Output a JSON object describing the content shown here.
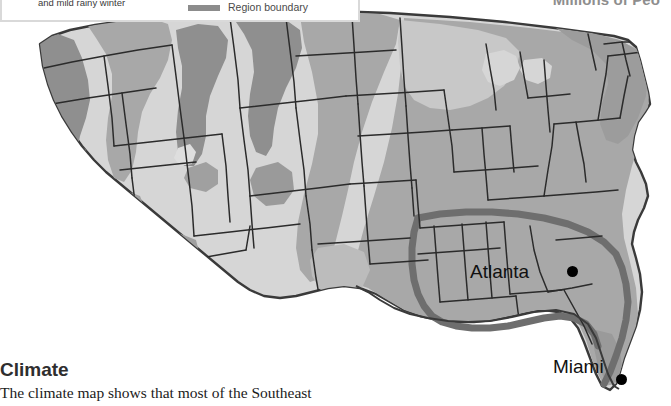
{
  "page": {
    "background_color": "#ffffff",
    "width": 671,
    "height": 406
  },
  "section_title_right": "Millions of Peo",
  "legend": {
    "box_border_color": "#d9d9d9",
    "entries": [
      {
        "id": "climate-zone",
        "label": "and mild rainy winter",
        "swatch_type": "text-only"
      },
      {
        "id": "region-boundary",
        "label": "Region boundary",
        "swatch_type": "thick-line",
        "swatch_color": "#8c8c8c"
      }
    ]
  },
  "map": {
    "name": "united-states-climate-map",
    "projection_note": "Contiguous United States",
    "colors": {
      "ocean": "#ffffff",
      "zone_light": "#d6d6d6",
      "zone_medium": "#a8a8a8",
      "zone_dark": "#8f8f8f",
      "zone_darkest": "#7e7e7e",
      "state_border": "#2b2b2b",
      "region_boundary": "#6e6e6e",
      "coast_outline": "#3a3a3a"
    },
    "cities": [
      {
        "name": "Atlanta",
        "label_x": 470,
        "label_y": 261,
        "dot_x": 572,
        "dot_y": 271
      },
      {
        "name": "Miami",
        "label_x": 553,
        "label_y": 356,
        "dot_x": 621,
        "dot_y": 379
      }
    ]
  },
  "body": {
    "heading": "Climate",
    "paragraph": "The climate map shows that most of the Southeast"
  }
}
